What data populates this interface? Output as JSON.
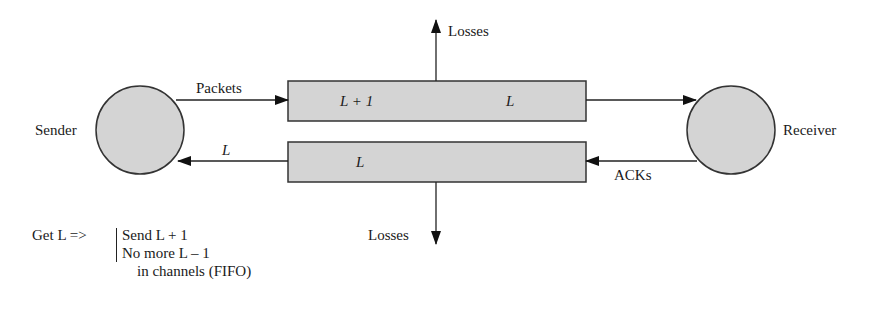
{
  "diagram": {
    "nodes": {
      "sender": {
        "label": "Sender"
      },
      "receiver": {
        "label": "Receiver"
      }
    },
    "channels": {
      "forward": {
        "left_label": "L + 1",
        "right_label": "L"
      },
      "backward": {
        "label": "L"
      }
    },
    "edges": {
      "packets": {
        "label": "Packets"
      },
      "ack_to_sender": {
        "label": "L"
      },
      "acks": {
        "label": "ACKs"
      },
      "losses_top": {
        "label": "Losses"
      },
      "losses_bottom": {
        "label": "Losses"
      }
    },
    "note": {
      "lead": "Get L =>",
      "lines": [
        "Send L + 1",
        "No more L – 1",
        "in channels (FIFO)"
      ]
    },
    "colors": {
      "fill": "#d4d4d4",
      "stroke": "#333333"
    }
  }
}
